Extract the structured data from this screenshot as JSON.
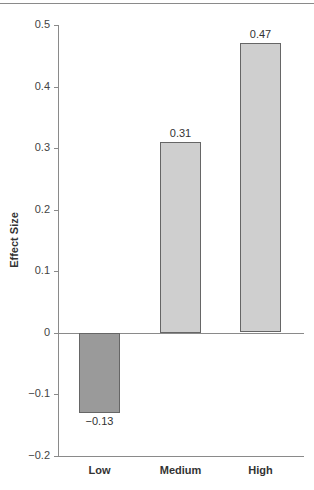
{
  "chart_data": {
    "type": "bar",
    "title": "",
    "xlabel": "",
    "ylabel": "Effect Size",
    "categories": [
      "Low",
      "Medium",
      "High"
    ],
    "values": [
      -0.13,
      0.31,
      0.47
    ],
    "value_labels": [
      "−0.13",
      "0.31",
      "0.47"
    ],
    "bar_colors": [
      "#9a9a9a",
      "#cfcfcf",
      "#cfcfcf"
    ],
    "ylim": [
      -0.2,
      0.5
    ],
    "yticks": [
      0.5,
      0.4,
      0.3,
      0.2,
      0.1,
      0,
      -0.1,
      -0.2
    ],
    "ytick_labels": [
      "0.5",
      "0.4",
      "0.3",
      "0.2",
      "0.1",
      "0",
      "−0.1",
      "−0.2"
    ],
    "grid": false,
    "legend": null
  }
}
